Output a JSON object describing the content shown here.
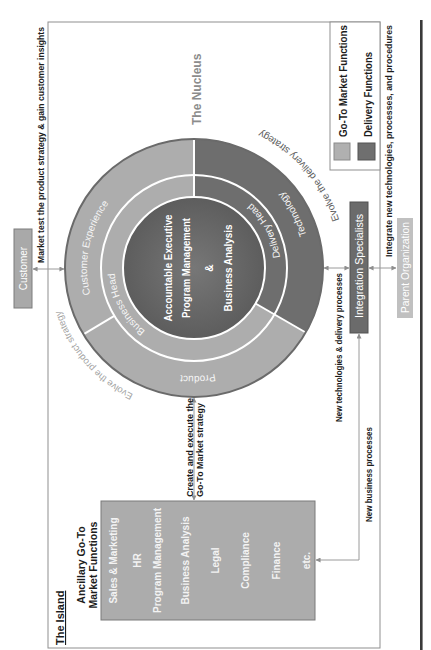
{
  "island": {
    "title": "The Island",
    "heading_line1": "Ancillary Go-To",
    "heading_line2": "Market Functions",
    "functions": [
      "Sales & Marketing",
      "HR",
      "Program Management",
      "Business Analysis",
      "Legal",
      "Compliance",
      "Finance",
      "etc."
    ]
  },
  "nucleus": {
    "title": "The Nucleus",
    "core": {
      "line1": "Accountable Executive",
      "line2": "Program Management",
      "line3": "&",
      "line4": "Business Analysis"
    },
    "middle_ring": {
      "business_head": "Business Head",
      "delivery_head": "Delivery Head"
    },
    "outer_ring": {
      "customer_experience": "Customer Experience",
      "product": "Product",
      "technology": "Technology"
    },
    "evolve_product": "Evolve the product strategy",
    "evolve_delivery": "Evolve the delivery strategy"
  },
  "entities": {
    "customer": "Customer",
    "integration": "Integration Specialists",
    "parent": "Parent Organization"
  },
  "flows": {
    "customer_feedback": "Market test the product strategy & gain customer insights",
    "go_to_market_line1": "Create and execute the",
    "go_to_market_line2": "Go-To Market strategy",
    "new_technologies": "New technologies & delivery processes",
    "new_business": "New business processes",
    "integrate": "Integrate new technologies, processes, and procedures"
  },
  "legend": {
    "items": [
      {
        "label": "Go-To Market Functions",
        "color": "#b0b0b0"
      },
      {
        "label": "Delivery Functions",
        "color": "#6f6f6f"
      }
    ]
  },
  "colors": {
    "go_to_market": "#adadad",
    "delivery": "#6e6e6e",
    "core": "#636363",
    "customer_box": "#a9a9a9",
    "island_box": "#acacac",
    "integration_box": "#6b6b6b",
    "parent_box": "#c0c0c0",
    "ring_outline": "#6a6a6a"
  }
}
